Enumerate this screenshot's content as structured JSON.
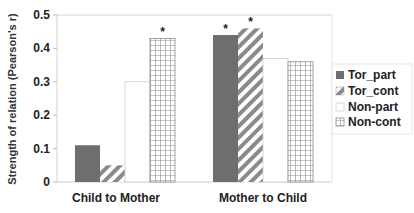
{
  "chart_data": {
    "type": "bar",
    "title": "",
    "xlabel": "",
    "ylabel": "Strength of relation (Pearson's r)",
    "ylim": [
      0,
      0.5
    ],
    "yticks": [
      "0",
      "0.1",
      "0.2",
      "0.3",
      "0.4",
      "0.5"
    ],
    "categories": [
      "Child to Mother",
      "Mother to Child"
    ],
    "series": [
      {
        "name": "Tor_part",
        "values": [
          0.11,
          0.44
        ],
        "significant": [
          false,
          true
        ],
        "pattern": "solid-gray"
      },
      {
        "name": "Tor_cont",
        "values": [
          0.05,
          0.46
        ],
        "significant": [
          false,
          true
        ],
        "pattern": "diagonal-stripes"
      },
      {
        "name": "Non-part",
        "values": [
          0.3,
          0.37
        ],
        "significant": [
          false,
          false
        ],
        "pattern": "white"
      },
      {
        "name": "Non-cont",
        "values": [
          0.43,
          0.36
        ],
        "significant": [
          true,
          false
        ],
        "pattern": "grid"
      }
    ],
    "annotations": [
      "* marks significant correlations"
    ],
    "grid": false,
    "legend_position": "right"
  },
  "colors": {
    "tor_part": "#6e6e6e",
    "stripe": "#8a8a8a",
    "grid_line": "#8c8c8c",
    "axis": "#cfcfcf"
  },
  "significance_marker": "*"
}
